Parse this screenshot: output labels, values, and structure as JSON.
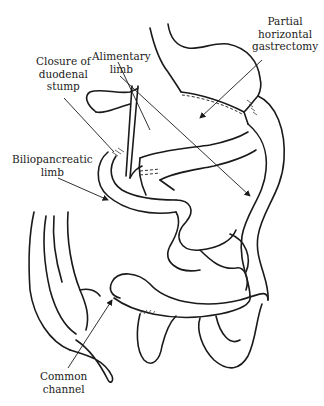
{
  "diagram": {
    "type": "anatomical line drawing",
    "labels": {
      "gastrectomy": [
        "Partial",
        "horizontal",
        "gastrectomy"
      ],
      "duodenal_stump": [
        "Closure of",
        "duodenal",
        "stump"
      ],
      "alimentary_limb": [
        "Alimentary",
        "limb"
      ],
      "biliopancreatic_limb": [
        "Biliopancreatic",
        "limb"
      ],
      "common_channel": [
        "Common",
        "channel"
      ]
    },
    "colors": {
      "ink": "#1a1a1a",
      "text": "#222222",
      "background": "#ffffff"
    }
  }
}
